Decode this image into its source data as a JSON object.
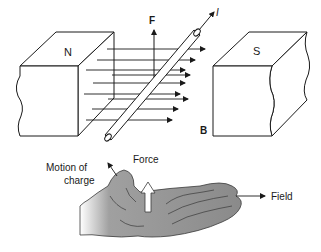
{
  "diagram": {
    "top": {
      "magnet_north_label": "N",
      "magnet_south_label": "S",
      "force_label": "F",
      "current_label": "I",
      "field_label": "B"
    },
    "bottom": {
      "motion_label_line1": "Motion of",
      "motion_label_line2": "charge",
      "force_label": "Force",
      "field_label": "Field"
    },
    "colors": {
      "line": "#1a1a1a",
      "hand_fill": "#8c8c8c",
      "hand_stroke": "#3a3a3a",
      "background": "#ffffff"
    }
  }
}
